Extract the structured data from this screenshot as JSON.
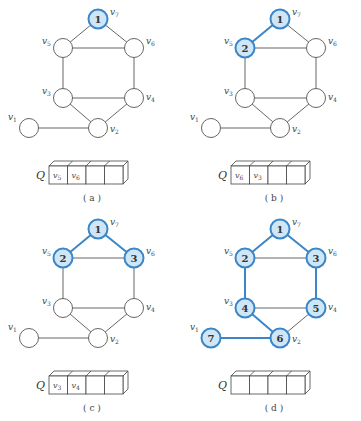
{
  "colors": {
    "highlight_fill": "#cfe6f7",
    "highlight_stroke": "#3a86c8",
    "edge_default": "#555555",
    "edge_highlight": "#3a86c8",
    "node_default_fill": "#ffffff",
    "node_default_stroke": "#555555"
  },
  "graph": {
    "vertices": [
      {
        "id": "v7",
        "label": "v",
        "sub": "7",
        "pos": [
          98,
          19
        ],
        "label_offset": [
          12,
          -4
        ]
      },
      {
        "id": "v5",
        "label": "v",
        "sub": "5",
        "pos": [
          63,
          48
        ],
        "label_offset": [
          -21,
          -4
        ]
      },
      {
        "id": "v6",
        "label": "v",
        "sub": "6",
        "pos": [
          134,
          48
        ],
        "label_offset": [
          12,
          -4
        ]
      },
      {
        "id": "v3",
        "label": "v",
        "sub": "3",
        "pos": [
          63,
          98
        ],
        "label_offset": [
          -21,
          -4
        ]
      },
      {
        "id": "v4",
        "label": "v",
        "sub": "4",
        "pos": [
          134,
          98
        ],
        "label_offset": [
          12,
          2
        ]
      },
      {
        "id": "v2",
        "label": "v",
        "sub": "2",
        "pos": [
          98,
          128
        ],
        "label_offset": [
          12,
          4
        ]
      },
      {
        "id": "v1",
        "label": "v",
        "sub": "1",
        "pos": [
          29,
          128
        ],
        "label_offset": [
          -21,
          -8
        ]
      }
    ],
    "edges": [
      [
        "v7",
        "v5"
      ],
      [
        "v7",
        "v6"
      ],
      [
        "v5",
        "v6"
      ],
      [
        "v5",
        "v3"
      ],
      [
        "v6",
        "v4"
      ],
      [
        "v3",
        "v4"
      ],
      [
        "v3",
        "v2"
      ],
      [
        "v4",
        "v2"
      ],
      [
        "v1",
        "v2"
      ]
    ]
  },
  "panels": [
    {
      "caption": "( a )",
      "offset": [
        0,
        0
      ],
      "visited": {
        "v7": "1"
      },
      "tree_edges": [],
      "queue_label": "Q",
      "queue": [
        "v5",
        "v6",
        "",
        ""
      ]
    },
    {
      "caption": "( b )",
      "offset": [
        182,
        0
      ],
      "visited": {
        "v7": "1",
        "v5": "2"
      },
      "tree_edges": [
        [
          "v7",
          "v5"
        ]
      ],
      "queue_label": "Q",
      "queue": [
        "v6",
        "v3",
        "",
        ""
      ]
    },
    {
      "caption": "( c )",
      "offset": [
        0,
        210
      ],
      "visited": {
        "v7": "1",
        "v5": "2",
        "v6": "3"
      },
      "tree_edges": [
        [
          "v7",
          "v5"
        ],
        [
          "v7",
          "v6"
        ]
      ],
      "queue_label": "Q",
      "queue": [
        "v3",
        "v4",
        "",
        ""
      ]
    },
    {
      "caption": "( d )",
      "offset": [
        182,
        210
      ],
      "visited": {
        "v7": "1",
        "v5": "2",
        "v6": "3",
        "v3": "4",
        "v4": "5",
        "v2": "6",
        "v1": "7"
      },
      "tree_edges": [
        [
          "v7",
          "v5"
        ],
        [
          "v7",
          "v6"
        ],
        [
          "v5",
          "v3"
        ],
        [
          "v6",
          "v4"
        ],
        [
          "v3",
          "v2"
        ],
        [
          "v1",
          "v2"
        ]
      ],
      "queue_label": "Q",
      "queue": [
        "",
        "",
        "",
        ""
      ]
    }
  ]
}
